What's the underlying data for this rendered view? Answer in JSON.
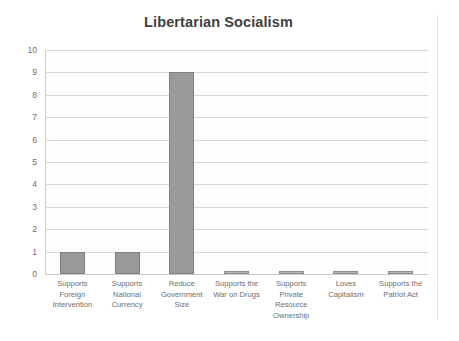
{
  "chart_data": {
    "type": "bar",
    "title": "Libertarian Socialism",
    "xlabel": "",
    "ylabel": "",
    "ylim": [
      0,
      10
    ],
    "ytick_step": 1,
    "yticks": [
      "10",
      "9",
      "8",
      "7",
      "6",
      "5",
      "4",
      "3",
      "2",
      "1",
      "0"
    ],
    "grid": "horizontal",
    "legend": "none",
    "categories": [
      "Supports Foreign Intervention",
      "Supports National Currency",
      "Reduce Government Size",
      "Supports the War on Drugs",
      "Supports Private Resource Ownership",
      "Loves Capitalism",
      "Supports the Patriot Act"
    ],
    "category_lines": [
      [
        "Supports",
        "Foreign",
        "Intervention"
      ],
      [
        "Supports",
        "National",
        "Currency"
      ],
      [
        "Reduce",
        "Government",
        "Size"
      ],
      [
        "Supports the",
        "War on Drugs"
      ],
      [
        "Supports",
        "Private",
        "Resource",
        "Ownership"
      ],
      [
        "Loves",
        "Capitalism"
      ],
      [
        "Supports the",
        "Patriot Act"
      ]
    ],
    "values": [
      1,
      1,
      9,
      0,
      0,
      0,
      0
    ],
    "colors": {
      "bar_fill": "#9a9a9a",
      "bar_border": "#7f7f7f",
      "gridline": "#d6d6d6",
      "axis": "#d0d0d0",
      "title_text": "#3f3f3f",
      "tick_text": "#6e6e6e",
      "plot_background": "#fdfdfd",
      "page_background": "#ffffff"
    }
  }
}
